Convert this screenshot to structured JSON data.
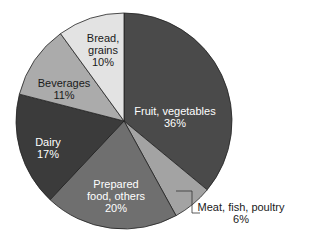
{
  "chart_data": {
    "type": "pie",
    "title": "",
    "start_angle_deg": 0,
    "direction": "clockwise",
    "categories": [
      "Fruit, vegetables",
      "Meat, fish, poultry",
      "Prepared food, others",
      "Dairy",
      "Beverages",
      "Bread, grains"
    ],
    "values": [
      36,
      6,
      20,
      17,
      11,
      10
    ],
    "slices": [
      {
        "label": "Fruit, vegetables",
        "value": 36,
        "display": "36%",
        "color": "#4a4a4a"
      },
      {
        "label": "Meat, fish, poultry",
        "value": 6,
        "display": "6%",
        "color": "#a3a3a3"
      },
      {
        "label": "Prepared food, others",
        "value": 20,
        "display": "20%",
        "color": "#6f6f6f"
      },
      {
        "label": "Dairy",
        "value": 17,
        "display": "17%",
        "color": "#3b3b3b"
      },
      {
        "label": "Beverages",
        "value": 11,
        "display": "11%",
        "color": "#ababab"
      },
      {
        "label": "Bread, grains",
        "value": 10,
        "display": "10%",
        "color": "#e3e3e3"
      }
    ]
  },
  "labels": {
    "fruit": {
      "line1": "Fruit, vegetables",
      "line2": "36%"
    },
    "meat": {
      "line1": "Meat, fish, poultry",
      "line2": "6%"
    },
    "prepared": {
      "line1": "Prepared",
      "line2": "food, others",
      "line3": "20%"
    },
    "dairy": {
      "line1": "Dairy",
      "line2": "17%"
    },
    "beverages": {
      "line1": "Beverages",
      "line2": "11%"
    },
    "bread": {
      "line1": "Bread,",
      "line2": "grains",
      "line3": "10%"
    }
  }
}
